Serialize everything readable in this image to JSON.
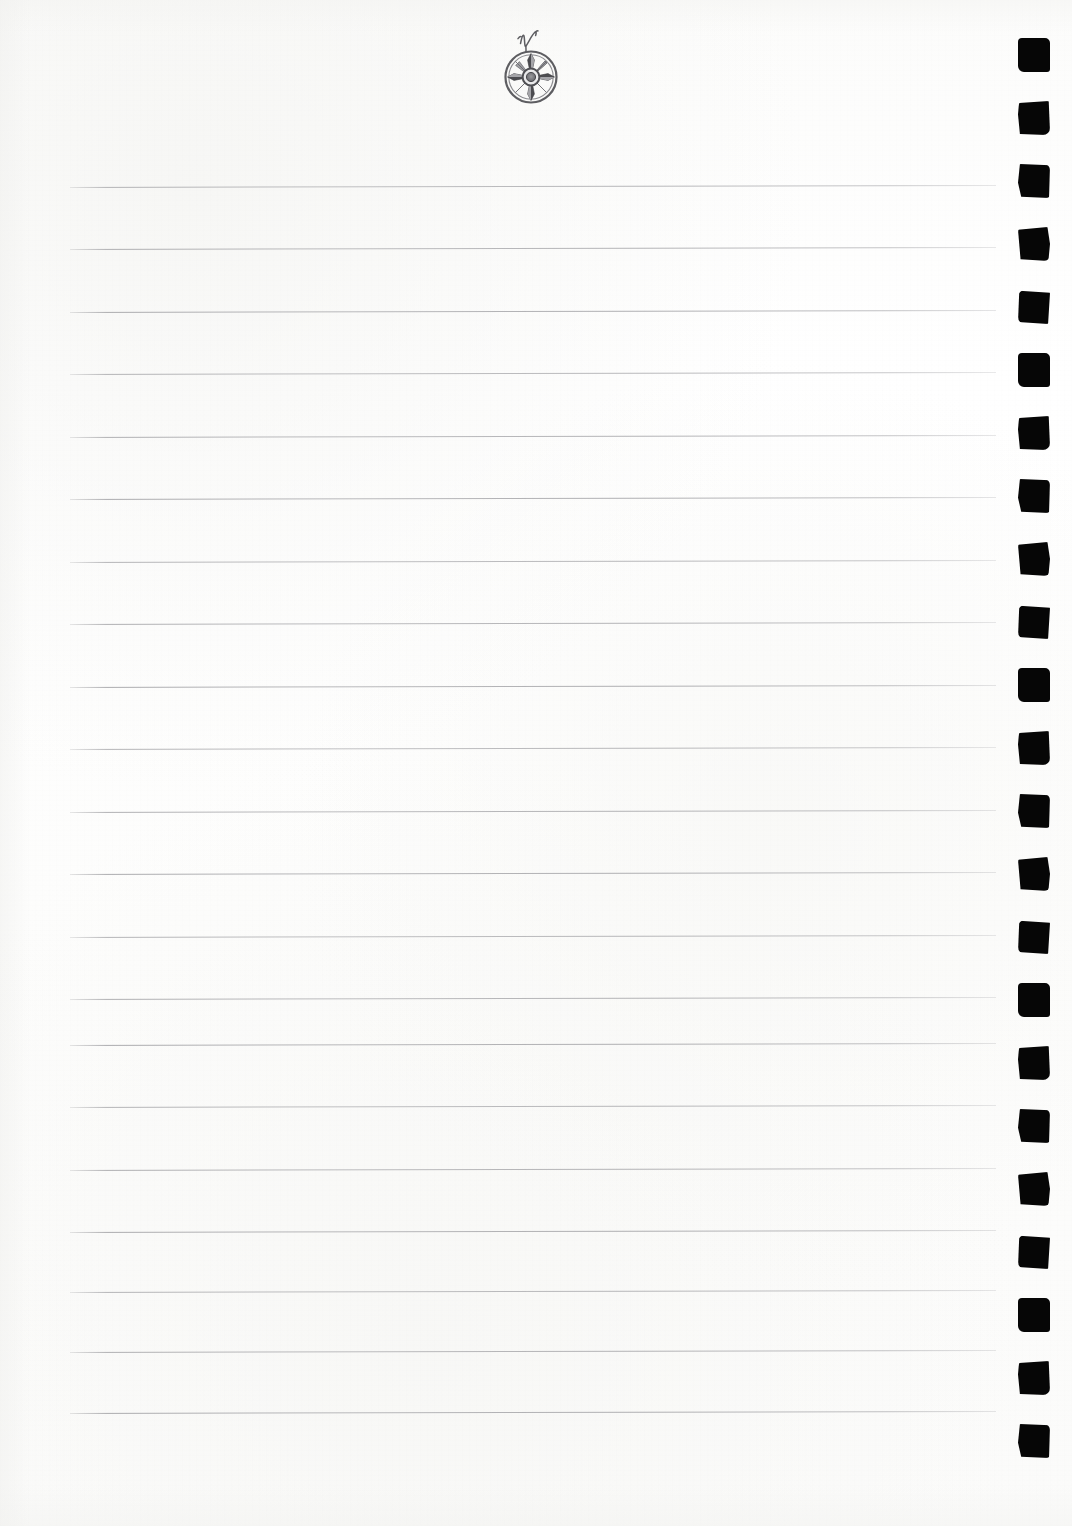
{
  "document": {
    "type": "lined-notebook-page",
    "title": "Blank Ruled Notebook Page",
    "page_width": 1072,
    "page_height": 1526,
    "paper_color": "#fdfdfd",
    "text_content": "",
    "visible_text": []
  },
  "emblem": {
    "name": "compass-rose",
    "letter": "N",
    "description": "eight-point compass rose star inside a circular ring with center hub",
    "color": "#6f6f72",
    "x": 494,
    "y": 22,
    "width": 76,
    "height": 90
  },
  "rules": {
    "color": "#96969a",
    "left": 70,
    "right": 996,
    "width": 926,
    "thickness": 1,
    "spacing": 62.5,
    "tilt_degrees": -0.12,
    "count": 20,
    "y_positions": [
      187,
      249,
      312,
      374,
      437,
      499,
      562,
      624,
      687,
      749,
      812,
      874,
      937,
      999,
      1045,
      1107,
      1170,
      1232,
      1292,
      1352,
      1413
    ]
  },
  "binding": {
    "name": "spiral-binding-holes",
    "color": "#060606",
    "hole_width": 32,
    "hole_height": 34,
    "left": 1018,
    "spacing": 63,
    "count": 23,
    "first_y": 38,
    "y_positions": [
      38,
      101,
      164,
      227,
      290,
      353,
      416,
      479,
      542,
      605,
      668,
      731,
      794,
      857,
      920,
      983,
      1046,
      1109,
      1172,
      1235,
      1298,
      1361,
      1424
    ]
  }
}
